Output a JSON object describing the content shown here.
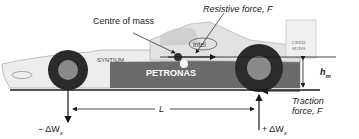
{
  "labels": {
    "centre_of_mass": "Centre of mass",
    "resistive_force": "Resistive force, F",
    "h_m": "h",
    "h_m_sub": "m",
    "L": "L",
    "traction_line1": "Traction",
    "traction_line2": "force, F",
    "minus_dw": "− ΔW",
    "plus_dw": "+ ΔW",
    "dw_sub": "x"
  },
  "car_livery": {
    "sponsor_main": "PETRONAS",
    "sponsor_top": "intel",
    "sponsor_side": "SYNTIUM",
    "sponsor_rear": "CREDIT SUISSE",
    "sponsor_nose": "intel"
  },
  "colors": {
    "line": "#1a1a1a",
    "car_body": "#e8e8e8",
    "car_dark": "#5a5a5a",
    "tyre": "#2b2b2b"
  }
}
